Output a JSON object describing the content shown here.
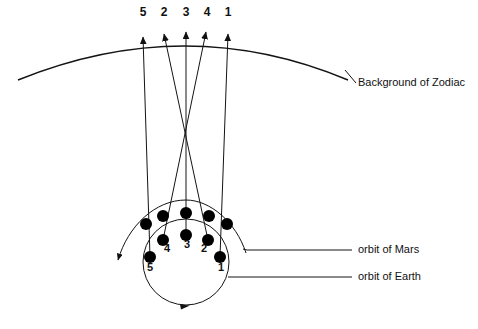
{
  "diagram": {
    "title_absent": true,
    "background_color": "#ffffff",
    "stroke_color": "#1a1a1a",
    "dot_color": "#000000"
  },
  "labels": {
    "zodiac": "Background of Zodiac",
    "mars_orbit": "orbit of Mars",
    "earth_orbit": "orbit of Earth"
  },
  "zodiac_marks": [
    {
      "label": "5",
      "x": 143,
      "y": 13,
      "tip_x": 143,
      "tip_y": 34
    },
    {
      "label": "2",
      "x": 163,
      "y": 13,
      "tip_x": 163,
      "tip_y": 31
    },
    {
      "label": "3",
      "x": 186,
      "y": 13,
      "tip_x": 186,
      "tip_y": 29
    },
    {
      "label": "4",
      "x": 206,
      "y": 13,
      "tip_x": 206,
      "tip_y": 29
    },
    {
      "label": "1",
      "x": 228,
      "y": 13,
      "tip_x": 228,
      "tip_y": 31
    }
  ],
  "earth_positions": [
    {
      "label": "1",
      "x": 220,
      "y": 257,
      "num_x": 220,
      "num_y": 264
    },
    {
      "label": "2",
      "x": 208,
      "y": 240,
      "num_x": 203,
      "num_y": 246
    },
    {
      "label": "3",
      "x": 186,
      "y": 235,
      "num_x": 186,
      "num_y": 243
    },
    {
      "label": "4",
      "x": 163,
      "y": 240,
      "num_x": 166,
      "num_y": 246
    },
    {
      "label": "5",
      "x": 150,
      "y": 257,
      "num_x": 150,
      "num_y": 264
    }
  ],
  "mars_positions": [
    {
      "label": "1",
      "x": 227,
      "y": 224
    },
    {
      "label": "2",
      "x": 209,
      "y": 216
    },
    {
      "label": "3",
      "x": 186,
      "y": 213
    },
    {
      "label": "4",
      "x": 163,
      "y": 216
    },
    {
      "label": "5",
      "x": 146,
      "y": 224
    }
  ],
  "geometry": {
    "zodiac_arc": "M 18,80 Q 186,12 348,80",
    "earth_orbit_circle": {
      "cx": 186,
      "cy": 262,
      "r": 43
    },
    "mars_arc": "M 117,262 Q 186,196 246,253",
    "convergence_point": {
      "x": 186,
      "y": 122
    }
  },
  "leader_lines": {
    "zodiac": {
      "x1": 344,
      "y1": 71,
      "x2": 354,
      "y2": 82
    },
    "mars": {
      "x1": 247,
      "y1": 250,
      "x2": 352,
      "y2": 250
    },
    "earth": {
      "x1": 228,
      "y1": 277,
      "x2": 352,
      "y2": 277
    }
  }
}
